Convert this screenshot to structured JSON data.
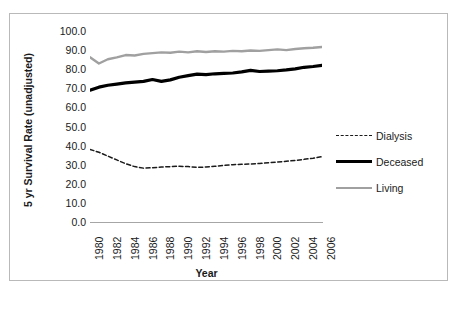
{
  "chart_data": {
    "type": "line",
    "title": "",
    "xlabel": "Year",
    "ylabel": "5 yr  Survival Rate (unadjusted)",
    "xlim": [
      1980,
      2006
    ],
    "ylim": [
      0.0,
      100.0
    ],
    "grid": false,
    "legend_position": "right",
    "y_ticks": [
      "100.0",
      "90.0",
      "80.0",
      "70.0",
      "60.0",
      "50.0",
      "40.0",
      "30.0",
      "20.0",
      "10.0",
      "0.0"
    ],
    "y_tick_values": [
      100.0,
      90.0,
      80.0,
      70.0,
      60.0,
      50.0,
      40.0,
      30.0,
      20.0,
      10.0,
      0.0
    ],
    "x_ticks": [
      "1980",
      "1982",
      "1984",
      "1986",
      "1988",
      "1990",
      "1992",
      "1994",
      "1996",
      "1998",
      "2000",
      "2002",
      "2004",
      "2006"
    ],
    "x": [
      1980,
      1981,
      1982,
      1983,
      1984,
      1985,
      1986,
      1987,
      1988,
      1989,
      1990,
      1991,
      1992,
      1993,
      1994,
      1995,
      1996,
      1997,
      1998,
      1999,
      2000,
      2001,
      2002,
      2003,
      2004,
      2005,
      2006
    ],
    "series": [
      {
        "name": "Dialysis",
        "style": "dashed",
        "color": "#1a1a1a",
        "values": [
          38.0,
          36.5,
          34.5,
          32.5,
          30.5,
          29.0,
          28.2,
          28.4,
          28.8,
          29.0,
          29.2,
          29.0,
          28.6,
          28.8,
          29.2,
          29.6,
          30.0,
          30.2,
          30.4,
          30.6,
          31.0,
          31.4,
          31.8,
          32.2,
          32.8,
          33.4,
          34.2
        ]
      },
      {
        "name": "Deceased",
        "style": "solid-thick",
        "color": "#000000",
        "values": [
          69.0,
          70.6,
          71.6,
          72.2,
          72.8,
          73.2,
          73.6,
          74.6,
          73.6,
          74.4,
          75.8,
          76.6,
          77.4,
          77.2,
          77.6,
          77.8,
          78.0,
          78.6,
          79.4,
          78.8,
          79.0,
          79.2,
          79.6,
          80.2,
          81.0,
          81.4,
          82.0
        ]
      },
      {
        "name": "Living",
        "style": "solid",
        "color": "#a0a0a0",
        "values": [
          86.2,
          83.0,
          85.2,
          86.2,
          87.4,
          87.2,
          88.0,
          88.4,
          88.8,
          88.6,
          89.2,
          88.8,
          89.4,
          89.0,
          89.4,
          89.2,
          89.6,
          89.4,
          89.8,
          89.6,
          90.0,
          90.4,
          90.0,
          90.6,
          91.0,
          91.2,
          91.6
        ]
      }
    ],
    "legend": [
      "Dialysis",
      "Deceased",
      "Living"
    ]
  }
}
